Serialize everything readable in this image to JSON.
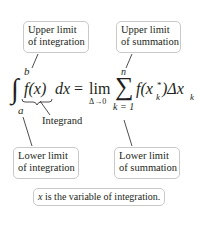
{
  "labels": {
    "upper_integration": [
      "Upper limit",
      "of integration"
    ],
    "upper_summation": [
      "Upper limit",
      "of summation"
    ],
    "lower_integration": [
      "Lower limit",
      "of integration"
    ],
    "lower_summation": [
      "Lower limit",
      "of summation"
    ],
    "integrand": "Integrand",
    "note_var": "x",
    "note_rest": " is the variable of integration."
  },
  "formula": {
    "integral_sign": "∫",
    "upper_limit": "b",
    "lower_limit": "a",
    "integrand": "f(x)",
    "differential": "dx",
    "equals": "=",
    "lim": "lim",
    "lim_sub": "Δ→0",
    "sigma": "∑",
    "sum_upper": "n",
    "sum_lower": "k = 1",
    "sum_term_f": "f(x",
    "sum_term_sub": "k",
    "sum_term_sup": "*",
    "sum_term_close": ")Δx",
    "sum_term_sub2": "k"
  },
  "colors": {
    "box_border": "#c9c9c9",
    "text": "#231f20"
  }
}
